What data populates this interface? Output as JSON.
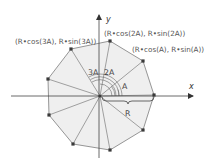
{
  "diagram": {
    "center": [
      100,
      96
    ],
    "vertices": [
      [
        154,
        95
      ],
      [
        143,
        61
      ],
      [
        110,
        41
      ],
      [
        71,
        49
      ],
      [
        48,
        79
      ],
      [
        49,
        115
      ],
      [
        73,
        144
      ],
      [
        110,
        150
      ],
      [
        143,
        130
      ]
    ],
    "colors": {
      "fill": "#efefef",
      "edge": "#8a8a8a",
      "spoke": "#8a8a8a",
      "vertex": "#3a3a3a",
      "axis": "#444444",
      "text": "#555555"
    },
    "axes": {
      "x_label": "x",
      "y_label": "y"
    },
    "point_labels": [
      {
        "text": "(R•cos(3A), R•sin(3A))",
        "x": 15,
        "y": 44
      },
      {
        "text": "(R•cos(2A), R•sin(2A))",
        "x": 104,
        "y": 36
      },
      {
        "text": "(R•cos(A), R•sin(A))",
        "x": 132,
        "y": 52
      }
    ],
    "angle_labels": [
      {
        "text": "3A",
        "x": 88,
        "y": 75
      },
      {
        "text": "2A",
        "x": 104,
        "y": 75
      },
      {
        "text": "A",
        "x": 122,
        "y": 89
      }
    ],
    "radius_label": "R"
  }
}
